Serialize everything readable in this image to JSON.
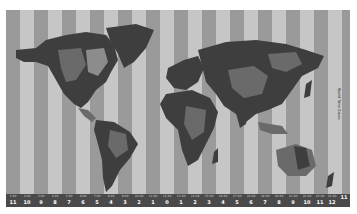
{
  "map": {
    "title": "World Time Zones",
    "colors": {
      "ocean_light": "#c4c4c4",
      "ocean_dark": "#9a9a9a",
      "land_dark": "#3e3e3e",
      "land_mid": "#6a6a6a",
      "land_light": "#8c8c8c",
      "bar": "#4a4a4a"
    },
    "zones": [
      {
        "time": "1:00",
        "offset": "11"
      },
      {
        "time": "2:00",
        "offset": "10"
      },
      {
        "time": "3:00",
        "offset": "9"
      },
      {
        "time": "4:00",
        "offset": "8"
      },
      {
        "time": "5:00",
        "offset": "7"
      },
      {
        "time": "6:00",
        "offset": "6"
      },
      {
        "time": "7:00",
        "offset": "5"
      },
      {
        "time": "8:00",
        "offset": "4"
      },
      {
        "time": "9:00",
        "offset": "3"
      },
      {
        "time": "10:00",
        "offset": "2"
      },
      {
        "time": "11:00",
        "offset": "1"
      },
      {
        "time": "12:00",
        "offset": "0"
      },
      {
        "time": "13:00",
        "offset": "1"
      },
      {
        "time": "14:00",
        "offset": "2"
      },
      {
        "time": "15:00",
        "offset": "3"
      },
      {
        "time": "16:00",
        "offset": "4"
      },
      {
        "time": "17:00",
        "offset": "5"
      },
      {
        "time": "18:00",
        "offset": "6"
      },
      {
        "time": "19:00",
        "offset": "7"
      },
      {
        "time": "20:00",
        "offset": "8"
      },
      {
        "time": "21:00",
        "offset": "9"
      },
      {
        "time": "22:00",
        "offset": "10"
      },
      {
        "time": "23:00",
        "offset": "11"
      },
      {
        "time": "24:00",
        "offset": "12"
      },
      {
        "time": "",
        "offset": "11"
      }
    ]
  }
}
